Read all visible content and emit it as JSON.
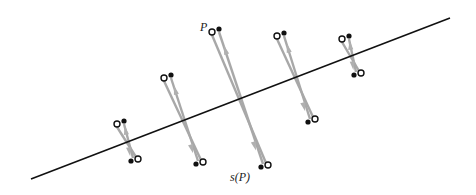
{
  "labels": {
    "point": "P",
    "image": "s(P)"
  },
  "colors": {
    "axis_line": "#111111",
    "segment": "#a8a8a8",
    "arrow": "#b0b0b0",
    "open_point_stroke": "#111111",
    "filled_point": "#111111"
  },
  "axis_line": {
    "x1": 31,
    "y1": 179,
    "x2": 450,
    "y2": 18
  },
  "pairs": [
    {
      "open_top": [
        117,
        124
      ],
      "dot_top": [
        124,
        121
      ],
      "dot_bottom": [
        131,
        161
      ],
      "open_bottom": [
        138,
        159
      ]
    },
    {
      "open_top": [
        164,
        78
      ],
      "dot_top": [
        171,
        75
      ],
      "dot_bottom": [
        196,
        164
      ],
      "open_bottom": [
        203,
        162
      ]
    },
    {
      "open_top": [
        212,
        32
      ],
      "dot_top": [
        219,
        29
      ],
      "dot_bottom": [
        261,
        167
      ],
      "open_bottom": [
        268,
        165
      ]
    },
    {
      "open_top": [
        277,
        36
      ],
      "dot_top": [
        284,
        33
      ],
      "dot_bottom": [
        308,
        122
      ],
      "open_bottom": [
        315,
        119
      ]
    },
    {
      "open_top": [
        342,
        39
      ],
      "dot_top": [
        349,
        36
      ],
      "dot_bottom": [
        354,
        75
      ],
      "open_bottom": [
        361,
        73
      ]
    }
  ],
  "label_positions": {
    "point": {
      "left": 200,
      "top": 21
    },
    "image": {
      "left": 230,
      "top": 171
    }
  }
}
